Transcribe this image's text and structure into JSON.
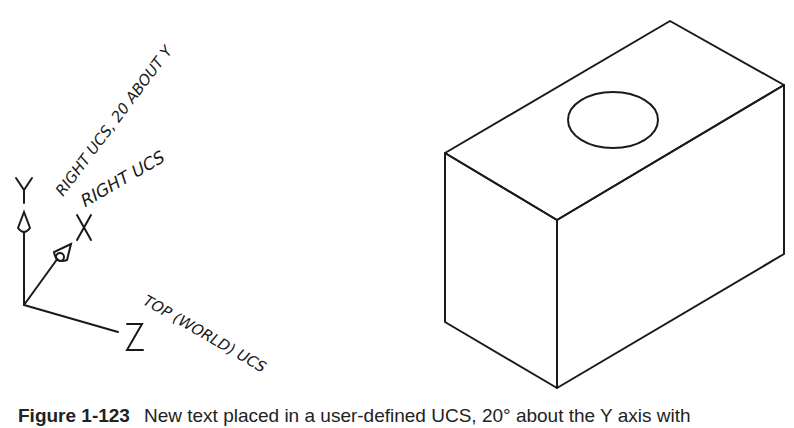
{
  "ucs_icon": {
    "axis_labels": {
      "y": "Y",
      "x": "X",
      "z": "Z"
    }
  },
  "annotations": {
    "right_ucs_rotated": "RIGHT UCS, 20 ABOUT Y",
    "right_ucs": "RIGHT UCS",
    "top_world_ucs": "TOP (WORLD) UCS"
  },
  "model": {
    "shape": "rectangular block with circular hole on top face",
    "stroke_color": "#1a1a1a"
  },
  "caption": {
    "label": "Figure 1-123",
    "text": "New text placed in a user-defined UCS, 20° about the Y axis with"
  }
}
